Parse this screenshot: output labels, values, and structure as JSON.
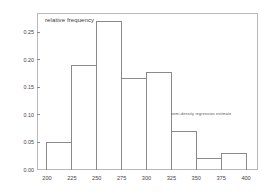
{
  "chart_data": {
    "type": "bar",
    "title": "",
    "subtitle": "",
    "xlabel": "",
    "ylabel": "relative frequency",
    "ylabel_position": "inside-top-left",
    "grid": false,
    "legend_position": "inside-right",
    "xlim": [
      190,
      412
    ],
    "ylim": [
      0.0,
      0.285
    ],
    "bin_width": 25,
    "bin_edges": [
      200,
      225,
      250,
      275,
      300,
      325,
      350,
      375,
      400
    ],
    "categories": [
      "200-225",
      "225-250",
      "250-275",
      "275-300",
      "300-325",
      "325-350",
      "350-375",
      "375-400"
    ],
    "values": [
      0.05,
      0.19,
      0.27,
      0.167,
      0.177,
      0.07,
      0.02,
      0.03
    ],
    "xticks": [
      200,
      225,
      250,
      275,
      300,
      325,
      350,
      375,
      400
    ],
    "xtick_labels": [
      "200",
      "225",
      "250",
      "275",
      "300",
      "325",
      "350",
      "375",
      "400"
    ],
    "yticks": [
      0.0,
      0.05,
      0.1,
      0.15,
      0.2,
      0.25
    ],
    "ytick_labels": [
      "0.00",
      "0.05",
      "0.10",
      "0.15",
      "0.20",
      "0.25"
    ],
    "annotations": [
      {
        "text": "semi-density regression estimate",
        "x": 355,
        "y": 0.102
      }
    ],
    "style": {
      "bar_fill": "none",
      "bar_stroke": "#8a8a8a",
      "frame_stroke": "#b9b9b9",
      "tick_stroke": "#8a8a8a",
      "text_color": "#444444",
      "background": "#ffffff"
    }
  }
}
